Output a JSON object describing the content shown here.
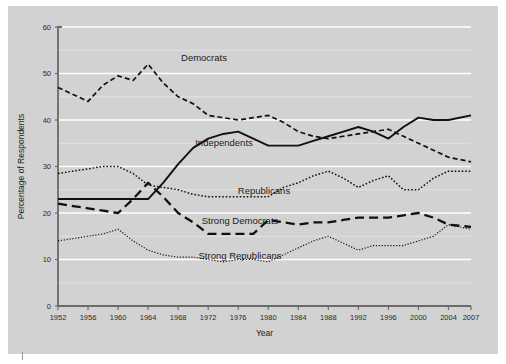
{
  "figure": {
    "background_color": "#d2d2d2",
    "gridline_color": "#ffffff",
    "axis_color": "#6b6b6b",
    "line_color": "#111111"
  },
  "axis_titles": {
    "x": "Year",
    "y": "Percentage of Respondents"
  },
  "series_labels": {
    "democrats": "Democrats",
    "independents": "Independents",
    "republicans": "Republicans",
    "strong_democrats": "Strong Democrats",
    "strong_republicans": "Strong Republicans"
  },
  "chart_data": {
    "type": "line",
    "title": "",
    "xlabel": "Year",
    "ylabel": "Percentage of Respondents",
    "xlim": [
      1952,
      2007
    ],
    "ylim": [
      0,
      60
    ],
    "yticks": [
      0,
      10,
      20,
      30,
      40,
      50,
      60
    ],
    "xticks": [
      1952,
      1956,
      1960,
      1964,
      1968,
      1972,
      1976,
      1980,
      1984,
      1988,
      1992,
      1996,
      2000,
      2004,
      2007
    ],
    "grid": "horizontal",
    "legend": "inline-labels",
    "x": [
      1952,
      1954,
      1956,
      1958,
      1960,
      1962,
      1964,
      1966,
      1968,
      1970,
      1972,
      1974,
      1976,
      1978,
      1980,
      1982,
      1984,
      1986,
      1988,
      1990,
      1992,
      1994,
      1996,
      1998,
      2000,
      2002,
      2004,
      2007
    ],
    "series": [
      {
        "name": "Democrats",
        "style": "dashed",
        "values": [
          47.0,
          45.5,
          44.0,
          47.5,
          49.5,
          48.5,
          52.0,
          48.0,
          45.0,
          43.5,
          41.0,
          40.5,
          40.0,
          40.5,
          41.0,
          39.5,
          37.5,
          36.5,
          36.0,
          36.5,
          37.0,
          37.5,
          38.0,
          36.5,
          35.0,
          33.5,
          32.0,
          31.0
        ]
      },
      {
        "name": "Independents",
        "style": "solid",
        "values": [
          23.0,
          23.0,
          23.0,
          23.0,
          23.0,
          23.0,
          23.0,
          26.5,
          30.5,
          34.0,
          36.0,
          37.0,
          37.5,
          36.0,
          34.5,
          34.5,
          34.5,
          35.5,
          36.5,
          37.5,
          38.5,
          37.5,
          36.0,
          38.5,
          40.5,
          40.0,
          40.0,
          41.0
        ]
      },
      {
        "name": "Republicans",
        "style": "dotted",
        "values": [
          28.5,
          29.0,
          29.5,
          30.0,
          30.0,
          28.5,
          26.0,
          25.5,
          25.0,
          24.0,
          23.5,
          23.5,
          23.5,
          23.5,
          23.5,
          25.5,
          26.5,
          28.0,
          29.0,
          27.5,
          25.5,
          27.0,
          28.0,
          25.0,
          25.0,
          27.5,
          29.0,
          29.0
        ]
      },
      {
        "name": "Strong Democrats",
        "style": "long-dash",
        "values": [
          22.0,
          21.5,
          21.0,
          20.5,
          20.0,
          23.0,
          26.5,
          23.5,
          20.0,
          18.0,
          15.5,
          15.5,
          15.5,
          15.5,
          18.5,
          18.0,
          17.5,
          18.0,
          18.0,
          18.5,
          19.0,
          19.0,
          19.0,
          19.5,
          20.0,
          19.0,
          17.5,
          17.0
        ]
      },
      {
        "name": "Strong Republicans",
        "style": "fine-dotted",
        "values": [
          14.0,
          14.5,
          15.0,
          15.5,
          16.5,
          14.0,
          12.0,
          11.0,
          10.5,
          10.5,
          10.0,
          9.5,
          10.0,
          10.0,
          9.5,
          11.0,
          12.5,
          14.0,
          15.0,
          13.5,
          12.0,
          13.0,
          13.0,
          13.0,
          14.0,
          15.0,
          17.5,
          16.5
        ]
      }
    ]
  }
}
